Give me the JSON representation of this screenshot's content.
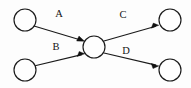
{
  "diagram": {
    "type": "directed-node-link-graph",
    "title": "",
    "background_color": "#fdfdfd",
    "stroke_color": "#1a1a1a",
    "node_fill_color": "#fefefe",
    "label_color": "#141414",
    "nodes": [
      {
        "id": "n1",
        "name": "source-node-top-left",
        "label": "",
        "cx": 25,
        "cy": 20,
        "r": 11
      },
      {
        "id": "n2",
        "name": "source-node-bottom-left",
        "label": "",
        "cx": 25,
        "cy": 70,
        "r": 11
      },
      {
        "id": "n3",
        "name": "hub-node-center",
        "label": "",
        "cx": 94,
        "cy": 47,
        "r": 11
      },
      {
        "id": "n4",
        "name": "target-node-top-right",
        "label": "",
        "cx": 170,
        "cy": 20,
        "r": 11
      },
      {
        "id": "n5",
        "name": "target-node-bottom-right",
        "label": "",
        "cx": 170,
        "cy": 70,
        "r": 11
      }
    ],
    "edges": [
      {
        "id": "e1",
        "label": "A",
        "from": "n1",
        "to": "n3",
        "x1": 34,
        "y1": 26,
        "x2": 84,
        "y2": 41,
        "label_x": 59,
        "label_y": 17
      },
      {
        "id": "e2",
        "label": "B",
        "from": "n2",
        "to": "n3",
        "x1": 34,
        "y1": 66,
        "x2": 84,
        "y2": 54,
        "label_x": 56,
        "label_y": 50
      },
      {
        "id": "e3",
        "label": "C",
        "from": "n3",
        "to": "n4",
        "x1": 104,
        "y1": 41,
        "x2": 159,
        "y2": 25,
        "label_x": 123,
        "label_y": 18
      },
      {
        "id": "e4",
        "label": "D",
        "from": "n3",
        "to": "n5",
        "x1": 104,
        "y1": 53,
        "x2": 159,
        "y2": 66,
        "label_x": 126,
        "label_y": 54
      }
    ]
  }
}
